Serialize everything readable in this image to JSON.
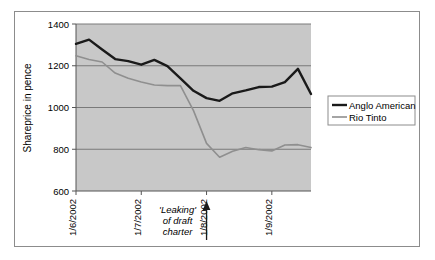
{
  "chart_data": {
    "type": "line",
    "title": "",
    "xlabel": "",
    "ylabel": "Shareprice in pence",
    "ylim": [
      600,
      1400
    ],
    "yticks": [
      600,
      800,
      1000,
      1200,
      1400
    ],
    "ytick_labels": [
      "600",
      "800",
      "1000",
      "1200",
      "1400"
    ],
    "grid": true,
    "grid_axis": "y",
    "legend_position": "right",
    "plot_background": "#c8c8c8",
    "x": [
      0,
      1,
      2,
      3,
      4,
      5,
      6,
      7,
      8,
      9,
      10,
      11,
      12,
      13,
      14,
      15,
      16,
      17,
      18
    ],
    "xticks": [
      0,
      5,
      10,
      15
    ],
    "xtick_labels": [
      "1/6/2002",
      "1/7/2002",
      "1/8/2002",
      "1/9/2002"
    ],
    "series": [
      {
        "name": "Anglo American",
        "color": "#1a1a1a",
        "width": 2.4,
        "values": [
          1305,
          1325,
          1278,
          1232,
          1222,
          1205,
          1228,
          1198,
          1140,
          1080,
          1045,
          1032,
          1068,
          1082,
          1098,
          1100,
          1122,
          1185,
          1065
        ]
      },
      {
        "name": "Rio Tinto",
        "color": "#8f8f8f",
        "width": 1.6,
        "values": [
          1248,
          1230,
          1218,
          1165,
          1140,
          1122,
          1108,
          1105,
          1105,
          985,
          828,
          762,
          790,
          808,
          798,
          792,
          820,
          822,
          808
        ]
      }
    ],
    "annotations": [
      {
        "text_lines": [
          "'Leaking'",
          "of draft",
          "charter"
        ],
        "arrow": "up",
        "x_index": 10
      }
    ]
  },
  "legend": {
    "entries": [
      {
        "label": "Anglo American"
      },
      {
        "label": "Rio Tinto"
      }
    ]
  },
  "colors": {
    "anglo_american": "#1a1a1a",
    "rio_tinto": "#8f8f8f",
    "plot_bg": "#c8c8c8",
    "gridline": "#7a7a7a",
    "border": "#8c8c8c"
  }
}
